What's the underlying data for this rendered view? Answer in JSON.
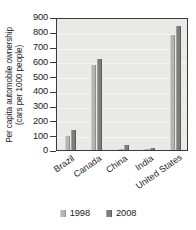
{
  "chart_data": {
    "type": "bar",
    "title": "",
    "xlabel": "",
    "ylabel": "Per capita automobile ownership (cars per 1000 people)",
    "ylabel_line1": "Per capita automobile ownership",
    "ylabel_line2": "(cars per 1000 people)",
    "categories": [
      "Brazil",
      "Canada",
      "China",
      "India",
      "United States"
    ],
    "series": [
      {
        "name": "1998",
        "color": "#b4b4b0",
        "values": [
          98,
          575,
          10,
          5,
          775
        ]
      },
      {
        "name": "2008",
        "color": "#7d7d7a",
        "values": [
          137,
          615,
          35,
          13,
          840
        ]
      }
    ],
    "ylim": [
      0,
      900
    ],
    "ytick_values": [
      0,
      100,
      200,
      300,
      400,
      500,
      600,
      700,
      800,
      900
    ],
    "ytick_labels": [
      "0",
      "100",
      "200",
      "300",
      "400",
      "500",
      "600",
      "700",
      "800",
      "900"
    ],
    "grid": true,
    "grid_axis": "y",
    "legend_position": "bottom",
    "legend_entries": [
      "1998",
      "2008"
    ],
    "plot_background": "#e9e9e6",
    "frame_color": "#3a3a3a"
  }
}
